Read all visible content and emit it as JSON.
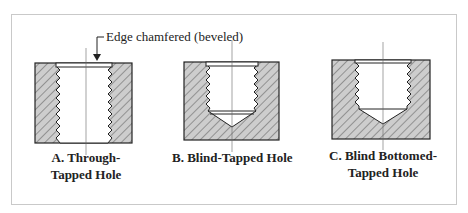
{
  "figure": {
    "callout": "Edge chamfered (beveled)",
    "panels": [
      {
        "id": "A",
        "caption_line1": "A. Through-",
        "caption_line2": "Tapped Hole"
      },
      {
        "id": "B",
        "caption_line1": "B. Blind-Tapped Hole",
        "caption_line2": ""
      },
      {
        "id": "C",
        "caption_line1": "C. Blind Bottomed-",
        "caption_line2": "Tapped Hole"
      }
    ]
  },
  "colors": {
    "hatch_fill": "#c8c8c8",
    "line": "#222222",
    "frame": "#c9c9c9"
  }
}
